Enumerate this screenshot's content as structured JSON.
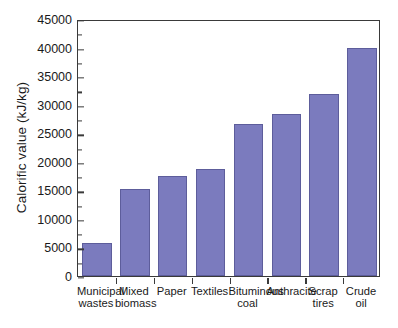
{
  "chart_data": {
    "type": "bar",
    "title": "",
    "xlabel": "",
    "ylabel": "Calorific value (kJ/kg)",
    "categories": [
      "Municipal wastes",
      "Mixed biomass",
      "Paper",
      "Textiles",
      "Bituminous coal",
      "Anthracite",
      "Scrap tires",
      "Crude oil"
    ],
    "category_lines": [
      [
        "Municipal",
        "wastes"
      ],
      [
        "Mixed",
        "biomass"
      ],
      [
        "Paper"
      ],
      [
        "Textiles"
      ],
      [
        "Bituminous",
        "coal"
      ],
      [
        "Anthracite"
      ],
      [
        "Scrap",
        "tires"
      ],
      [
        "Crude",
        "oil"
      ]
    ],
    "values": [
      5800,
      15200,
      17500,
      18800,
      26600,
      28400,
      31900,
      40000
    ],
    "ylim": [
      0,
      45000
    ],
    "ytick_labels": [
      "0",
      "5000",
      "10000",
      "15000",
      "20000",
      "25000",
      "30000",
      "35000",
      "40000",
      "45000"
    ],
    "ytick_values": [
      0,
      5000,
      10000,
      15000,
      20000,
      25000,
      30000,
      35000,
      40000,
      45000
    ],
    "ytick_minor_step": 2500,
    "grid": false,
    "legend": null,
    "bar_color": "#7b7bbe",
    "bar_edge_color": "#5d5d9b",
    "axis_color": "#3a3a3a"
  }
}
